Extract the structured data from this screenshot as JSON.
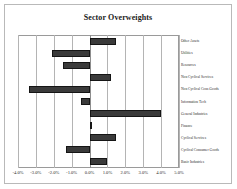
{
  "chart_data": {
    "type": "bar",
    "orientation": "horizontal",
    "title": "Sector Overweights",
    "xlabel": "",
    "ylabel": "",
    "xlim": [
      -4.0,
      5.0
    ],
    "xtick_labels": [
      "-4.0%",
      "-3.0%",
      "-2.0%",
      "-1.0%",
      "0.0%",
      "1.0%",
      "2.0%",
      "3.0%",
      "4.0%",
      "5.0%"
    ],
    "xtick_values": [
      -4.0,
      -3.0,
      -2.0,
      -1.0,
      0.0,
      1.0,
      2.0,
      3.0,
      4.0,
      5.0
    ],
    "grid": true,
    "grid_axis": "x",
    "legend": false,
    "bar_color": "#3a3a3a",
    "bar_edge_color": "#151515",
    "categories": [
      "Other Assets",
      "Utilities",
      "Resources",
      "Non Cyclical Services",
      "Non Cyclical Cons Goods",
      "Information Tech",
      "General Industries",
      "Finance",
      "Cyclical Services",
      "Cyclical Consumer Goods",
      "Basic Industries"
    ],
    "values": [
      1.5,
      -2.1,
      -1.5,
      1.2,
      -3.4,
      -0.5,
      4.0,
      0.05,
      1.5,
      -1.3,
      1.0
    ],
    "unit": "%"
  }
}
